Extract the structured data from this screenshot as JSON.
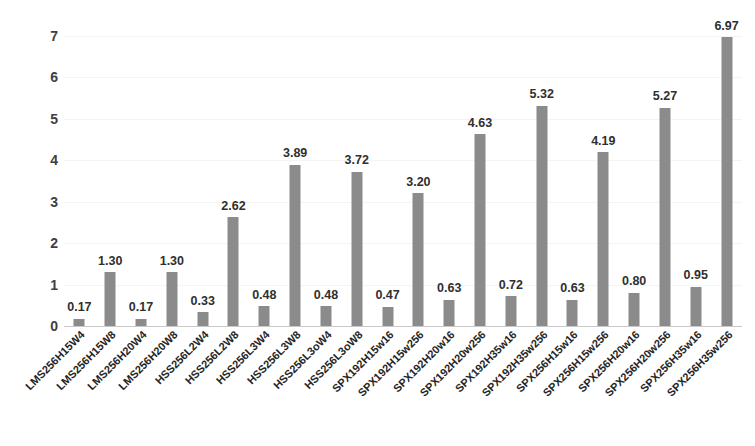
{
  "chart_data": {
    "type": "bar",
    "title": "",
    "subtitle": "",
    "xlabel": "",
    "ylabel": "",
    "ylim": [
      0,
      7
    ],
    "yticks": [
      0,
      1,
      2,
      3,
      4,
      5,
      6,
      7
    ],
    "ytick_labels": [
      "0",
      "1",
      "2",
      "3",
      "4",
      "5",
      "6",
      "7"
    ],
    "grid": true,
    "legend": false,
    "bar_color": "#8b8b8b",
    "value_label_format": "0.00",
    "categories": [
      "LMS256H15W4",
      "LMS256H15W8",
      "LMS256H20W4",
      "LMS256H20W8",
      "HSS256L2W4",
      "HSS256L2W8",
      "HSS256L3W4",
      "HSS256L3W8",
      "HSS256L3oW4",
      "HSS256L3oW8",
      "SPX192H15w16",
      "SPX192H15w256",
      "SPX192H20w16",
      "SPX192H20w256",
      "SPX192H35w16",
      "SPX192H35w256",
      "SPX256H15w16",
      "SPX256H15w256",
      "SPX256H20w16",
      "SPX256H20w256",
      "SPX256H35w16",
      "SPX256H35w256"
    ],
    "values": [
      0.17,
      1.3,
      0.17,
      1.3,
      0.33,
      2.62,
      0.48,
      3.89,
      0.48,
      3.72,
      0.47,
      3.2,
      0.63,
      4.63,
      0.72,
      5.32,
      0.63,
      4.19,
      0.8,
      5.27,
      0.95,
      6.97
    ],
    "value_labels": [
      "0.17",
      "1.30",
      "0.17",
      "1.30",
      "0.33",
      "2.62",
      "0.48",
      "3.89",
      "0.48",
      "3.72",
      "0.47",
      "3.20",
      "0.63",
      "4.63",
      "0.72",
      "5.32",
      "0.63",
      "4.19",
      "0.80",
      "5.27",
      "0.95",
      "6.97"
    ]
  }
}
